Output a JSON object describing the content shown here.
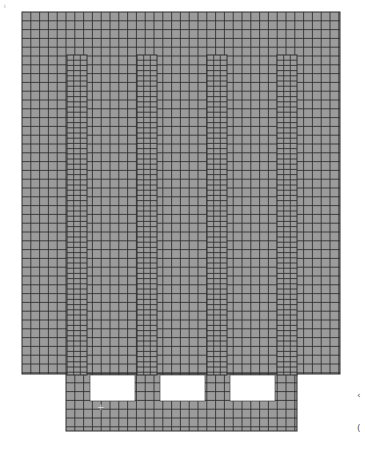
{
  "figure": {
    "type": "finite-element-mesh",
    "colors": {
      "fill": "#9b9b9b",
      "grid_line": "#2e2e2e",
      "background": "#ffffff",
      "hole": "#ffffff"
    },
    "corner_label": "ı",
    "side_marks": [
      "‹",
      "("
    ],
    "main_block": {
      "x": 22,
      "y": 12,
      "width": 318,
      "height": 362,
      "pitch": 8.8
    },
    "base_block": {
      "x": 66,
      "y": 374,
      "width": 231,
      "height": 57,
      "pitch": 8.8
    },
    "columns": [
      {
        "x": 67,
        "y": 55,
        "width": 20,
        "height": 320
      },
      {
        "x": 137,
        "y": 55,
        "width": 20,
        "height": 320
      },
      {
        "x": 207,
        "y": 55,
        "width": 20,
        "height": 320
      },
      {
        "x": 277,
        "y": 55,
        "width": 20,
        "height": 320
      }
    ],
    "holes": [
      {
        "x": 90,
        "y": 375,
        "width": 45,
        "height": 26
      },
      {
        "x": 160,
        "y": 375,
        "width": 45,
        "height": 26
      },
      {
        "x": 230,
        "y": 375,
        "width": 45,
        "height": 26
      }
    ],
    "marker": {
      "symbol": "+",
      "x": 97,
      "y": 410
    }
  }
}
